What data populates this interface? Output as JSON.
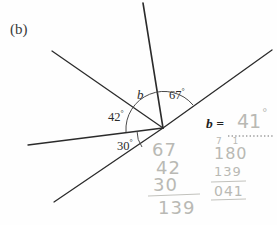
{
  "part": {
    "label": "(b)"
  },
  "figure": {
    "type": "angles-at-a-point-diagram",
    "vertex": {
      "x": 163,
      "y": 128
    },
    "angle_labels": [
      {
        "name": "angle-42",
        "text": "42",
        "degree": "°"
      },
      {
        "name": "angle-b",
        "text": "b"
      },
      {
        "name": "angle-67",
        "text": "67",
        "degree": "°"
      },
      {
        "name": "angle-30",
        "text": "30",
        "degree": "°"
      }
    ],
    "rays": [
      {
        "name": "ray-upper-left",
        "x": 52,
        "y": 51
      },
      {
        "name": "ray-up-vertical",
        "x": 143,
        "y": 3
      },
      {
        "name": "ray-upper-right",
        "x": 272,
        "y": 50
      },
      {
        "name": "ray-left-horizontal",
        "x": 28,
        "y": 145
      },
      {
        "name": "ray-lower-left",
        "x": 54,
        "y": 202
      }
    ]
  },
  "answer": {
    "prompt": "b =",
    "value": "41",
    "degree_symbol": "°"
  },
  "working": {
    "addition": {
      "operands": [
        "67",
        "42",
        "30"
      ],
      "sum": "139"
    },
    "subtraction": {
      "borrow_marks": "7 1",
      "minuend": "180",
      "subtrahend": "139",
      "difference": "041"
    }
  },
  "colors": {
    "ink": "#2b2b2b",
    "pencil": "#b9b9b4",
    "paper": "#fefefe"
  }
}
